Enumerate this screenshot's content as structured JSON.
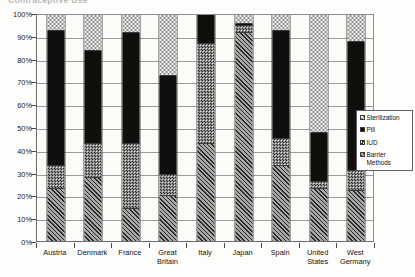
{
  "title_fragment": "Contraceptive Use",
  "chart_data": {
    "type": "bar",
    "subtype": "stacked-100-percent",
    "title": "Contraceptive Use",
    "xlabel": "",
    "ylabel": "",
    "ylim": [
      0,
      100
    ],
    "ytick_labels": [
      "0%",
      "10%",
      "20%",
      "30%",
      "40%",
      "50%",
      "60%",
      "70%",
      "80%",
      "90%",
      "100%"
    ],
    "ytick_values": [
      0,
      10,
      20,
      30,
      40,
      50,
      60,
      70,
      80,
      90,
      100
    ],
    "grid": true,
    "legend_position": "right",
    "categories": [
      "Austria",
      "Denmark",
      "France",
      "Great\nBritain",
      "Italy",
      "Japan",
      "Spain",
      "United\nStates",
      "West\nGermany"
    ],
    "series": [
      {
        "name": "Barrier Methods",
        "pattern": "diagonal-hatch",
        "values": [
          23,
          28,
          14,
          20,
          43,
          92,
          33,
          23,
          22
        ]
      },
      {
        "name": "IUD",
        "pattern": "checkerboard-dark",
        "values": [
          10,
          15,
          29,
          9,
          44,
          3,
          12,
          3,
          9
        ]
      },
      {
        "name": "Pill",
        "pattern": "solid-black",
        "values": [
          60,
          41,
          49,
          44,
          13,
          1,
          48,
          22,
          57
        ]
      },
      {
        "name": "Sterilization",
        "pattern": "checkerboard-light",
        "values": [
          7,
          16,
          8,
          27,
          0,
          4,
          7,
          52,
          12
        ]
      }
    ]
  },
  "legend": {
    "items": [
      {
        "label": "Sterilization",
        "pattern": "checkerboard-light"
      },
      {
        "label": "Pill",
        "pattern": "solid-black"
      },
      {
        "label": "IUD",
        "pattern": "checkerboard-dark"
      },
      {
        "label": "Barrier\nMethods",
        "pattern": "diagonal-hatch"
      }
    ]
  }
}
